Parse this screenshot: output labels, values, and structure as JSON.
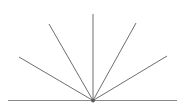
{
  "figure": {
    "type": "line-drawing",
    "canvas": {
      "width": 185,
      "height": 108,
      "background": "#ffffff"
    },
    "colors": {
      "stroke": "#6e6e6e",
      "baseline_stroke": "#8a8a8a",
      "vertex": "#5a5a5a",
      "background": "#ffffff"
    },
    "vertex": {
      "x": 93,
      "y": 100.5,
      "label": "common-vertex"
    },
    "baseline": {
      "label": "horizontal baseline",
      "x1": 8,
      "y1": 100.5,
      "x2": 177,
      "y2": 100.5,
      "stroke_width": 1.2
    },
    "rays": [
      {
        "name": "ray-lower-left",
        "label": "leftmost shallow ray",
        "x1": 93,
        "y1": 100.5,
        "x2": 19,
        "y2": 57,
        "angle_deg": 150,
        "stroke_width": 1.0
      },
      {
        "name": "ray-upper-left",
        "label": "upper left diagonal ray",
        "x1": 93,
        "y1": 100.5,
        "x2": 49,
        "y2": 24,
        "angle_deg": 120,
        "stroke_width": 1.0
      },
      {
        "name": "ray-vertical",
        "label": "vertical center ray",
        "x1": 93,
        "y1": 100.5,
        "x2": 93,
        "y2": 14,
        "angle_deg": 90,
        "stroke_width": 1.0
      },
      {
        "name": "ray-upper-right",
        "label": "upper right diagonal ray",
        "x1": 93,
        "y1": 100.5,
        "x2": 136,
        "y2": 23,
        "angle_deg": 61,
        "stroke_width": 1.0
      },
      {
        "name": "ray-lower-right",
        "label": "rightmost shallow ray",
        "x1": 93,
        "y1": 100.5,
        "x2": 167,
        "y2": 56,
        "angle_deg": 31,
        "stroke_width": 1.0
      }
    ]
  }
}
